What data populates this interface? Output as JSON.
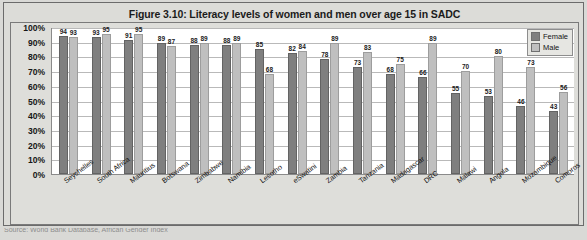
{
  "chart_data": {
    "type": "bar",
    "title": "Figure 3.10: Literacy levels of women and men over age 15 in SADC",
    "xlabel": "",
    "ylabel": "",
    "ylim": [
      0,
      100
    ],
    "grid": true,
    "legend_position": "top-right",
    "y_ticks": [
      "0%",
      "10%",
      "20%",
      "30%",
      "40%",
      "50%",
      "60%",
      "70%",
      "80%",
      "90%",
      "100%"
    ],
    "categories": [
      "Seychelles",
      "South Africa",
      "Mauritius",
      "Botswana",
      "Zimbabwe",
      "Namibia",
      "Lesotho",
      "eSwatini",
      "Zambia",
      "Tanzania",
      "Madagascar",
      "DRC",
      "Malawi",
      "Angola",
      "Mozambique",
      "Comoros"
    ],
    "series": [
      {
        "name": "Female",
        "color": "#7f7f7f",
        "values": [
          94,
          93,
          91,
          89,
          88,
          88,
          85,
          82,
          78,
          73,
          68,
          66,
          55,
          53,
          46,
          43
        ]
      },
      {
        "name": "Male",
        "color": "#bfbfbf",
        "values": [
          93,
          95,
          95,
          87,
          89,
          89,
          68,
          84,
          89,
          83,
          75,
          89,
          70,
          80,
          73,
          56
        ]
      }
    ]
  },
  "source": {
    "text": "Source: World Bank Database, African Gender Index"
  }
}
